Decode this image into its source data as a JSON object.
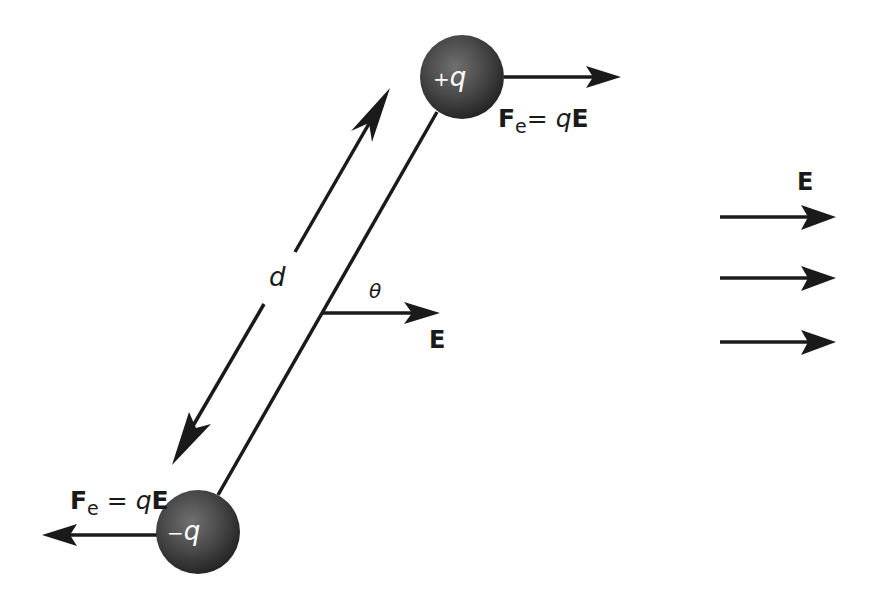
{
  "diagram": {
    "colors": {
      "ink": "#1a1a1a",
      "charge_light": "#6b6b6b",
      "charge_dark": "#2a2a2a",
      "background": "#ffffff"
    },
    "positive_charge": {
      "sign": "+",
      "symbol": "q",
      "center": [
        462,
        77
      ],
      "radius": 42
    },
    "negative_charge": {
      "sign": "−",
      "symbol": "q",
      "center": [
        198,
        532
      ],
      "radius": 42
    },
    "force_on_positive": {
      "F": "F",
      "subscript": "e",
      "equals": "=",
      "q": "q",
      "E": "E",
      "direction": "right"
    },
    "force_on_negative": {
      "F": "F",
      "subscript": "e",
      "equals": "=",
      "q": "q",
      "E": "E",
      "direction": "left"
    },
    "separation_label": "d",
    "angle_label": "θ",
    "local_field_label": "E",
    "uniform_field": {
      "label": "E",
      "arrow_count": 3,
      "direction": "right"
    }
  }
}
